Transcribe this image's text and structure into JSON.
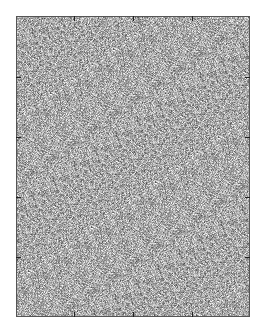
{
  "chart_data": {
    "type": "heatmap",
    "title": "",
    "xlabel": "",
    "ylabel": "",
    "colormap": "gray",
    "mean_color": "#a9a9a9",
    "grid": false,
    "legend": null,
    "x_ticks": {
      "count": 3,
      "labels": [],
      "positions_px": [
        74,
        133,
        192
      ]
    },
    "y_ticks": {
      "count": 4,
      "labels": [],
      "positions_px": [
        77,
        137,
        197,
        257
      ]
    },
    "frame_px": {
      "left": 16,
      "top": 16,
      "right": 250,
      "bottom": 317
    }
  },
  "colors": {
    "background": "#ffffff",
    "frame": "#555555",
    "tick": "#222222",
    "noise_mean": "#a9a9a9"
  }
}
